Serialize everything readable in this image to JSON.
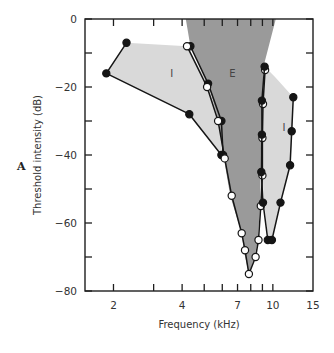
{
  "panel_label": "A",
  "chart_data": {
    "type": "line",
    "title": "",
    "xlabel": "Frequency (kHz)",
    "ylabel": "Threshold intensity (dB)",
    "xscale": "log",
    "xlim": [
      1.5,
      15
    ],
    "ylim": [
      -80,
      0
    ],
    "xticks": [
      2,
      3,
      4,
      5,
      6,
      7,
      8,
      9,
      10
    ],
    "xtick_labels": [
      {
        "value": 2,
        "label": "2"
      },
      {
        "value": 4,
        "label": "4"
      },
      {
        "value": 7,
        "label": "7"
      },
      {
        "value": 10,
        "label": "10"
      },
      {
        "value": 15,
        "label": "15"
      }
    ],
    "yticks": [
      0,
      -10,
      -20,
      -30,
      -40,
      -50,
      -60,
      -70,
      -80
    ],
    "ytick_labels": [
      {
        "value": 0,
        "label": "0"
      },
      {
        "value": -20,
        "label": "-20"
      },
      {
        "value": -40,
        "label": "-40"
      },
      {
        "value": -60,
        "label": "-60"
      },
      {
        "value": -80,
        "label": "-80"
      }
    ],
    "grid": false,
    "legend": null,
    "regions": [
      {
        "name": "E",
        "label": "E",
        "fill": "#9a9a9a",
        "description": "excitatory area",
        "polygon": [
          [
            4.15,
            0
          ],
          [
            10.3,
            0
          ],
          [
            9.1,
            -14
          ],
          [
            8.85,
            -40
          ],
          [
            8.8,
            -55
          ],
          [
            8.55,
            -66
          ],
          [
            8.3,
            -70
          ],
          [
            7.85,
            -75
          ],
          [
            7.5,
            -69
          ],
          [
            7.3,
            -63
          ],
          [
            6.5,
            -52
          ],
          [
            6.1,
            -41
          ],
          [
            5.8,
            -31
          ],
          [
            5.2,
            -19
          ],
          [
            4.35,
            -8
          ]
        ],
        "label_pos": [
          6.65,
          -17
        ]
      },
      {
        "name": "I-low",
        "label": "I",
        "fill": "#d9d9d9",
        "description": "inhibitory area (low side)",
        "polygon": [
          [
            2.28,
            -7
          ],
          [
            4.2,
            -8
          ],
          [
            5.2,
            -19
          ],
          [
            5.85,
            -31
          ],
          [
            6.0,
            -40
          ],
          [
            4.3,
            -28
          ],
          [
            1.86,
            -16
          ]
        ],
        "label_pos": [
          3.6,
          -17
        ]
      },
      {
        "name": "I-high",
        "label": "I",
        "fill": "#d9d9d9",
        "description": "inhibitory area (high side)",
        "polygon": [
          [
            9.2,
            -14
          ],
          [
            10.2,
            -17
          ],
          [
            12.3,
            -23
          ],
          [
            12.2,
            -33
          ],
          [
            11.9,
            -43
          ],
          [
            10.8,
            -54
          ],
          [
            9.9,
            -64
          ],
          [
            9.5,
            -64
          ],
          [
            9.15,
            -54
          ],
          [
            9.0,
            -45
          ],
          [
            9.0,
            -35
          ],
          [
            9.0,
            -24
          ]
        ],
        "label_pos": [
          11.2,
          -33
        ]
      }
    ],
    "series": [
      {
        "name": "low-side inhibition (filled)",
        "marker": "filled",
        "x": [
          2.28,
          1.86,
          4.3,
          5.95
        ],
        "y": [
          -7,
          -16,
          -28,
          -40
        ]
      },
      {
        "name": "excitatory low edge (filled)",
        "marker": "filled",
        "x": [
          4.35,
          5.2,
          5.95,
          6.05
        ],
        "y": [
          -8,
          -19,
          -30,
          -40
        ]
      },
      {
        "name": "excitatory tuning curve (open)",
        "marker": "open",
        "x": [
          4.2,
          5.15,
          5.75,
          6.15,
          6.6,
          7.3,
          7.55,
          7.85,
          8.4,
          8.65,
          8.85,
          9.0,
          9.0,
          9.05,
          9.25
        ],
        "y": [
          -8,
          -20,
          -30,
          -41,
          -52,
          -63,
          -68,
          -75,
          -70,
          -65,
          -55,
          -46,
          -35,
          -25,
          -15
        ]
      },
      {
        "name": "high-side inhibition (filled)",
        "marker": "filled",
        "x": [
          9.2,
          8.95,
          8.95,
          8.9,
          9.05,
          9.5,
          9.9,
          10.8,
          11.9,
          12.1,
          12.3
        ],
        "y": [
          -14,
          -24,
          -34,
          -45,
          -54,
          -65,
          -65,
          -54,
          -43,
          -33,
          -23
        ]
      }
    ]
  }
}
